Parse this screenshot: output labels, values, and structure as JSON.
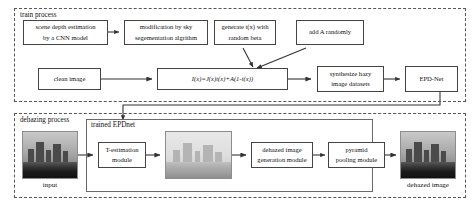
{
  "figure": {
    "type": "flow-diagram",
    "title": ""
  },
  "train_process": {
    "label": "train process",
    "nodes": {
      "depth": {
        "line1": "scene depth estimation",
        "line2": "by a CNN model"
      },
      "sky": {
        "line1": "modification by sky",
        "line2": "segementation algrithm"
      },
      "tx": {
        "line1": "generate t(x) with",
        "line2": "random beta"
      },
      "addA": {
        "line1": "add  A randomly"
      },
      "clean": {
        "line1": "clean image"
      },
      "formula": {
        "line1": "I(x)=J(x)t(x)+A(1-t(x))"
      },
      "synth": {
        "line1": "synthesize hazy",
        "line2": "image datasets"
      },
      "epdnet": {
        "line1": "EPD-Net"
      }
    }
  },
  "dehazing_process": {
    "label": "dehazing process",
    "trained_label": "trained EPDnet",
    "nodes": {
      "test": {
        "line1": "T-estimation",
        "line2": "module"
      },
      "dehazed_gen": {
        "line1": "dehazed image",
        "line2": "generation module"
      },
      "pyramid": {
        "line1": "pyramid",
        "line2": "pooling module"
      }
    },
    "captions": {
      "input": "input",
      "output": "dehazed image"
    },
    "thumbnails": {
      "input": "hazy-cityscape-input",
      "middle": "hazy-cityscape-intermediate",
      "output": "dehazed-cityscape-output"
    }
  },
  "colors": {
    "stroke": "#444444",
    "dashed": "#555555",
    "text": "#111111",
    "page_bg": "#ffffff"
  }
}
